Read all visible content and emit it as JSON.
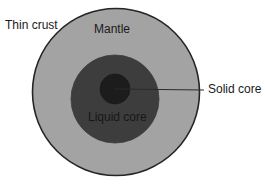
{
  "diagram": {
    "labels": {
      "thin_crust": "Thin crust",
      "mantle": "Mantle",
      "liquid_core": "Liquid core",
      "solid_core": "Solid core"
    },
    "colors": {
      "background": "#ffffff",
      "crust_outline": "#262626",
      "mantle_fill": "#a3a3a3",
      "liquid_core_fill": "#3d3d3d",
      "solid_core_fill": "#1c1c1c",
      "leader_line": "#2b2b2b",
      "text": "#1a1a1a"
    },
    "geometry": {
      "outer_circle": {
        "cx": 116,
        "cy": 92,
        "r": 84
      },
      "liquid_core_circle": {
        "cx": 115,
        "cy": 99,
        "r": 44
      },
      "solid_core_circle": {
        "cx": 115,
        "cy": 89,
        "r": 15
      },
      "leader_line": {
        "x1": 115,
        "y1": 89,
        "x2": 204,
        "y2": 90
      }
    }
  }
}
